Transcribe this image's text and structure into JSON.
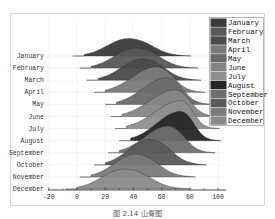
{
  "caption": "图 2.14 山脊图",
  "chart_data": {
    "type": "ridgeline",
    "title": "",
    "xlabel": "",
    "ylabel": "",
    "xlim": [
      -20,
      105
    ],
    "xticks": [
      -20,
      0,
      20,
      40,
      60,
      80,
      100
    ],
    "grid": true,
    "legend_position": "upper right",
    "categories": [
      "January",
      "February",
      "March",
      "April",
      "May",
      "June",
      "July",
      "August",
      "September",
      "October",
      "November",
      "December"
    ],
    "series": [
      {
        "name": "January",
        "color": "#3a3a3a",
        "min": 5,
        "max": 75,
        "peak": 35,
        "height": 0.65
      },
      {
        "name": "February",
        "color": "#575757",
        "min": 10,
        "max": 80,
        "peak": 40,
        "height": 0.75
      },
      {
        "name": "March",
        "color": "#4a4a4a",
        "min": 15,
        "max": 82,
        "peak": 45,
        "height": 0.8
      },
      {
        "name": "April",
        "color": "#7a7a7a",
        "min": 20,
        "max": 85,
        "peak": 55,
        "height": 0.95
      },
      {
        "name": "May",
        "color": "#6a6a6a",
        "min": 28,
        "max": 90,
        "peak": 62,
        "height": 1.0
      },
      {
        "name": "June",
        "color": "#858585",
        "min": 32,
        "max": 95,
        "peak": 68,
        "height": 1.0
      },
      {
        "name": "July",
        "color": "#8e8e8e",
        "min": 35,
        "max": 95,
        "peak": 72,
        "height": 1.05
      },
      {
        "name": "August",
        "color": "#262626",
        "min": 38,
        "max": 96,
        "peak": 72,
        "height": 1.1
      },
      {
        "name": "September",
        "color": "#6e6e6e",
        "min": 30,
        "max": 92,
        "peak": 63,
        "height": 1.0
      },
      {
        "name": "October",
        "color": "#5a5a5a",
        "min": 20,
        "max": 86,
        "peak": 50,
        "height": 0.95
      },
      {
        "name": "November",
        "color": "#7a7a7a",
        "min": 10,
        "max": 78,
        "peak": 40,
        "height": 0.85
      },
      {
        "name": "December",
        "color": "#8a8a8a",
        "min": 0,
        "max": 75,
        "peak": 32,
        "height": 0.75
      }
    ]
  }
}
